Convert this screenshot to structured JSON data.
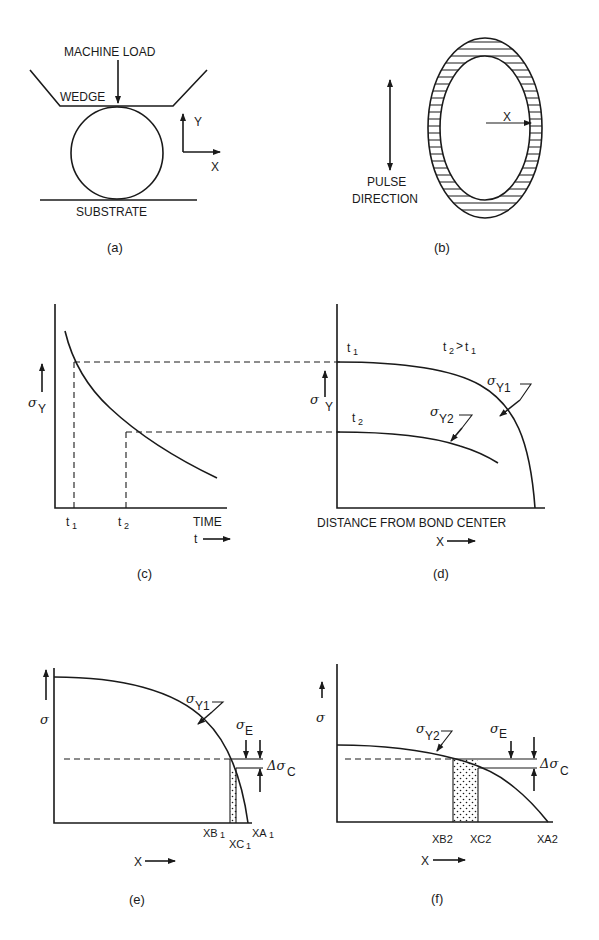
{
  "figure": {
    "panels": [
      {
        "id": "a",
        "caption": "(a)",
        "labels": {
          "machine_load": "MACHINE LOAD",
          "wedge": "WEDGE",
          "substrate": "SUBSTRATE",
          "axis_y": "Y",
          "axis_x": "X"
        }
      },
      {
        "id": "b",
        "caption": "(b)",
        "labels": {
          "pulse_line1": "PULSE",
          "pulse_line2": "DIRECTION",
          "radius": "X"
        }
      },
      {
        "id": "c",
        "caption": "(c)",
        "labels": {
          "y_sigma": "σ",
          "y_sub": "Y",
          "t1": "t",
          "t1_sub": "1",
          "t2": "t",
          "t2_sub": "2",
          "x_label": "TIME",
          "x_arrow_label": "t"
        }
      },
      {
        "id": "d",
        "caption": "(d)",
        "labels": {
          "y_sigma": "σ",
          "y_sub": "Y",
          "t1": "t",
          "t1_sub": "1",
          "t2": "t",
          "t2_sub": "2",
          "relation": "t",
          "relation_sub_a": "2",
          "relation_gt": ">",
          "relation_b": "t",
          "relation_sub_b": "1",
          "curve1_sigma": "σ",
          "curve1_sub": "Y1",
          "curve2_sigma": "σ",
          "curve2_sub": "Y2",
          "x_label": "DISTANCE FROM BOND CENTER",
          "x_arrow_label": "X"
        }
      },
      {
        "id": "e",
        "caption": "(e)",
        "labels": {
          "y_sigma": "σ",
          "curve_sigma": "σ",
          "curve_sub": "Y1",
          "sigma_e": "σ",
          "sigma_e_sub": "E",
          "delta": "Δσ",
          "delta_sub": "C",
          "xb": "XB",
          "xb_sub": "1",
          "xc": "XC",
          "xc_sub": "1",
          "xa": "XA",
          "xa_sub": "1",
          "x_arrow_label": "X"
        }
      },
      {
        "id": "f",
        "caption": "(f)",
        "labels": {
          "y_sigma": "σ",
          "curve_sigma": "σ",
          "curve_sub": "Y2",
          "sigma_e": "σ",
          "sigma_e_sub": "E",
          "delta": "Δσ",
          "delta_sub": "C",
          "xb": "XB2",
          "xc": "XC2",
          "xa": "XA2",
          "x_arrow_label": "X"
        }
      }
    ]
  }
}
